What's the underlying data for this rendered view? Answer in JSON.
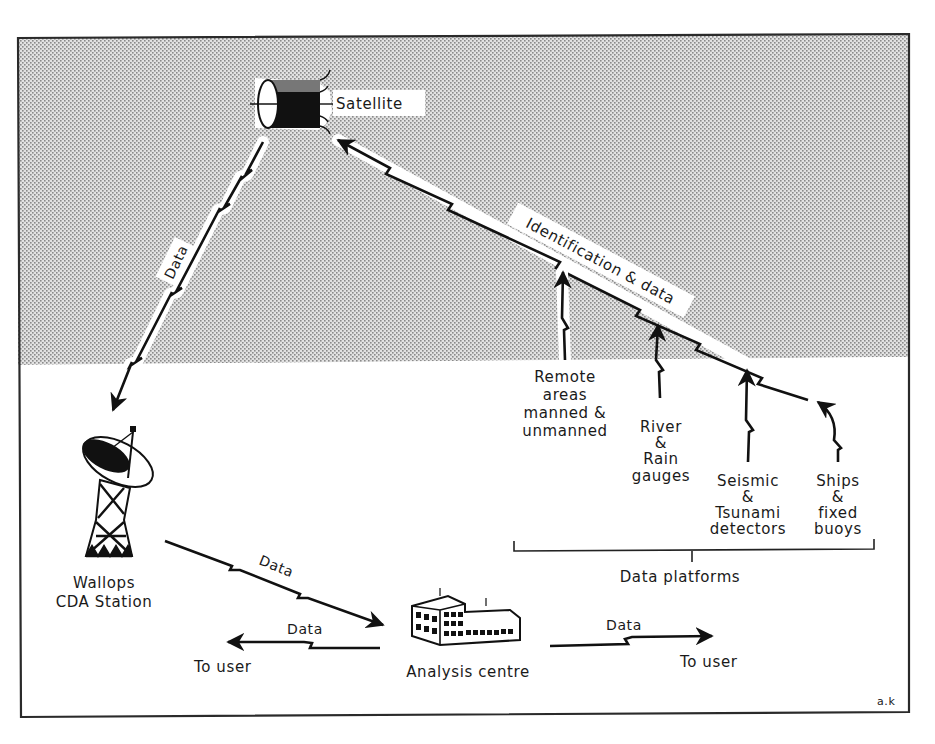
{
  "diagram": {
    "type": "satellite data collection system schematic",
    "colors": {
      "sky_stipple": "#c8c8c8",
      "frame": "#2a2a2a",
      "ink": "#111111",
      "ground": "#ffffff"
    },
    "nodes": {
      "satellite": {
        "label": "Satellite",
        "icon": "satellite-icon"
      },
      "ground_station": {
        "label_line1": "Wallops",
        "label_line2": "CDA Station",
        "icon": "radar-dish-icon"
      },
      "analysis_centre": {
        "label": "Analysis centre",
        "icon": "building-icon"
      },
      "user_left": {
        "label": "To user"
      },
      "user_right": {
        "label": "To user"
      }
    },
    "links": {
      "satellite_to_station": {
        "label": "Data"
      },
      "platforms_to_satellite": {
        "label": "Identification & data"
      },
      "station_to_centre": {
        "label": "Data"
      },
      "centre_to_user_left": {
        "label": "Data"
      },
      "centre_to_user_right": {
        "label": "Data"
      }
    },
    "platforms": {
      "group_label": "Data platforms",
      "items": [
        {
          "lines": [
            "Remote",
            "areas",
            "manned &",
            "unmanned"
          ]
        },
        {
          "lines": [
            "River",
            "&",
            "Rain",
            "gauges"
          ]
        },
        {
          "lines": [
            "Seismic",
            "&",
            "Tsunami",
            "detectors"
          ]
        },
        {
          "lines": [
            "Ships",
            "&",
            "fixed",
            "buoys"
          ]
        }
      ]
    },
    "signature": "a.k"
  }
}
